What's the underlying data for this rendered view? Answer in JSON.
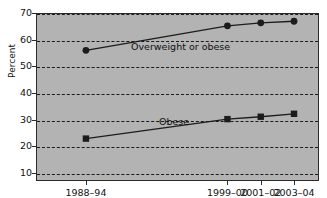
{
  "chart_data": {
    "type": "line",
    "title": "",
    "subtitle": "",
    "xlabel": "",
    "ylabel": "Percent",
    "ylim": [
      7,
      70
    ],
    "xlim": [
      1988,
      2005
    ],
    "grid": true,
    "grid_style": "dashed-horizontal",
    "legend_position": "inline-annotation",
    "background_color": "#b3b3b3",
    "line_color": "#1c1c1c",
    "marker_color": "#1c1c1c",
    "categories": [
      "1988–94",
      "1999–00",
      "2001–02",
      "2003–04"
    ],
    "x_positions": [
      1991.0,
      1999.5,
      2001.5,
      2003.5
    ],
    "y_ticks": [
      10,
      20,
      30,
      40,
      50,
      60,
      70
    ],
    "y_tick_labels": [
      "10",
      "20",
      "30",
      "40",
      "50",
      "60",
      "70"
    ],
    "series": [
      {
        "name": "Overweight or obese",
        "marker": "circle",
        "values": [
          56.0,
          65.2,
          66.3,
          66.9
        ],
        "annotation": "Overweight or obese"
      },
      {
        "name": "Obese",
        "marker": "square",
        "values": [
          22.9,
          30.2,
          31.1,
          32.2
        ],
        "annotation": "Obese"
      }
    ]
  },
  "axes": {
    "y_title": "Percent",
    "y_labels": [
      "70",
      "60",
      "50",
      "40",
      "30",
      "20",
      "10"
    ],
    "x_labels": [
      "1988–94",
      "1999–00",
      "2001–02",
      "2003–04"
    ]
  },
  "annotations": {
    "upper": "Overweight or obese",
    "lower": "Obese"
  }
}
